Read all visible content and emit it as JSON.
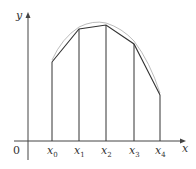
{
  "axes": {
    "x_label": "x",
    "y_label": "y",
    "origin_label": "0"
  },
  "points": [
    {
      "name": "x",
      "sub": "0",
      "px": 52,
      "py": 62
    },
    {
      "name": "x",
      "sub": "1",
      "px": 79,
      "py": 29
    },
    {
      "name": "x",
      "sub": "2",
      "px": 106,
      "py": 25
    },
    {
      "name": "x",
      "sub": "3",
      "px": 134,
      "py": 44
    },
    {
      "name": "x",
      "sub": "4",
      "px": 160,
      "py": 95
    }
  ],
  "colors": {
    "axis": "#444444",
    "polygon": "#333333",
    "curve": "#aaaaaa"
  }
}
